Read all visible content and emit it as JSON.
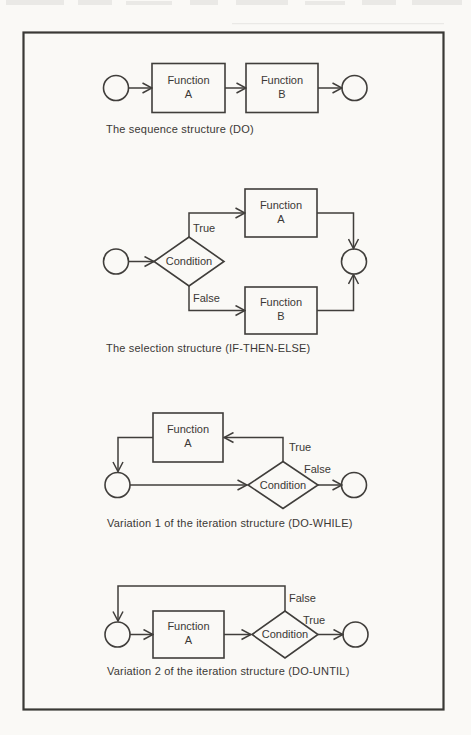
{
  "colors": {
    "ink": "#403e3b",
    "paper": "#faf9f6",
    "text": "#3a3835"
  },
  "diagrams": [
    {
      "name": "sequence",
      "caption": "The sequence structure (DO)",
      "boxes": [
        {
          "line1": "Function",
          "line2": "A"
        },
        {
          "line1": "Function",
          "line2": "B"
        }
      ]
    },
    {
      "name": "selection",
      "caption": "The selection structure (IF-THEN-ELSE)",
      "condition_label": "Condition",
      "branch_true": "True",
      "branch_false": "False",
      "boxes": [
        {
          "line1": "Function",
          "line2": "A"
        },
        {
          "line1": "Function",
          "line2": "B"
        }
      ]
    },
    {
      "name": "iteration_do_while",
      "caption": "Variation 1 of the iteration structure (DO-WHILE)",
      "condition_label": "Condition",
      "branch_true": "True",
      "branch_false": "False",
      "boxes": [
        {
          "line1": "Function",
          "line2": "A"
        }
      ]
    },
    {
      "name": "iteration_do_until",
      "caption": "Variation 2 of the iteration structure (DO-UNTIL)",
      "condition_label": "Condition",
      "branch_true": "True",
      "branch_false": "False",
      "boxes": [
        {
          "line1": "Function",
          "line2": "A"
        }
      ]
    }
  ]
}
